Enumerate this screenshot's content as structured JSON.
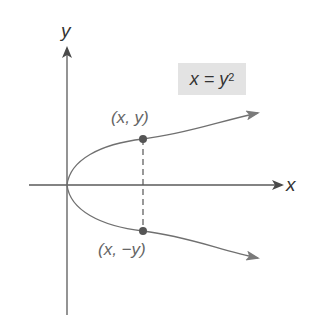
{
  "diagram": {
    "equation": {
      "lhs": "x = y",
      "exponent": "2"
    },
    "axes": {
      "x_label": "x",
      "y_label": "y"
    },
    "points": [
      {
        "label": "(x, y)",
        "position": "upper"
      },
      {
        "label": "(x, −y)",
        "position": "lower"
      }
    ],
    "colors": {
      "axis": "#5a5a5a",
      "curve": "#707070",
      "point": "#555555",
      "label_box": "#e3e3e3"
    }
  }
}
